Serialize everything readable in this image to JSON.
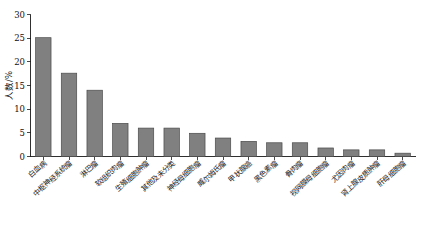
{
  "chart_data": {
    "type": "bar",
    "title": "",
    "xlabel": "",
    "ylabel": "人数/%",
    "ylim": [
      0,
      30
    ],
    "yticks": [
      0,
      5,
      10,
      15,
      20,
      25,
      30
    ],
    "grid": false,
    "legend": "none",
    "bar_color": "#808080",
    "bar_edge_color": "#4a4a4a",
    "categories": [
      "白血病",
      "中枢神经系统瘤",
      "淋巴瘤",
      "软组织肉瘤",
      "生殖细胞肿瘤",
      "其他及未分类",
      "神经母细胞瘤",
      "威尔姆氏瘤",
      "甲状腺癌",
      "黑色素瘤",
      "骨肉瘤",
      "视网膜母细胞瘤",
      "尤因肉瘤",
      "肾上腺皮质肿瘤",
      "肝母细胞瘤"
    ],
    "values": [
      25.1,
      17.6,
      14.0,
      7.0,
      6.0,
      6.0,
      4.9,
      3.9,
      3.2,
      2.9,
      2.9,
      1.8,
      1.4,
      1.4,
      0.7
    ]
  }
}
